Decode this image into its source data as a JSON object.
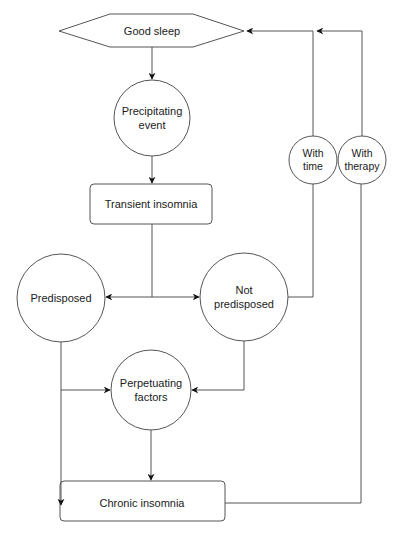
{
  "diagram": {
    "nodes": {
      "good_sleep": {
        "label": "Good sleep",
        "shape": "hexagon"
      },
      "precipitating": {
        "line1": "Precipitating",
        "line2": "event",
        "shape": "circle"
      },
      "transient": {
        "label": "Transient insomnia",
        "shape": "rounded-rect"
      },
      "predisposed": {
        "label": "Predisposed",
        "shape": "circle"
      },
      "not_predisposed": {
        "line1": "Not",
        "line2": "predisposed",
        "shape": "circle"
      },
      "with_time": {
        "line1": "With",
        "line2": "time",
        "shape": "circle"
      },
      "with_therapy": {
        "line1": "With",
        "line2": "therapy",
        "shape": "circle"
      },
      "perpetuating": {
        "line1": "Perpetuating",
        "line2": "factors",
        "shape": "circle"
      },
      "chronic": {
        "label": "Chronic insomnia",
        "shape": "rounded-rect"
      }
    },
    "edges": [
      {
        "from": "Good sleep",
        "to": "Precipitating event"
      },
      {
        "from": "Precipitating event",
        "to": "Transient insomnia"
      },
      {
        "from": "Transient insomnia",
        "to": "Predisposed"
      },
      {
        "from": "Transient insomnia",
        "to": "Not predisposed"
      },
      {
        "from": "Not predisposed",
        "via": "With time",
        "to": "Good sleep"
      },
      {
        "from": "Predisposed",
        "to": "Perpetuating factors"
      },
      {
        "from": "Not predisposed",
        "to": "Perpetuating factors"
      },
      {
        "from": "Predisposed",
        "to": "Chronic insomnia"
      },
      {
        "from": "Perpetuating factors",
        "to": "Chronic insomnia"
      },
      {
        "from": "Chronic insomnia",
        "via": "With therapy",
        "to": "Good sleep"
      }
    ],
    "colors": {
      "stroke": "#555555",
      "text": "#1a1a1a",
      "background": "#ffffff"
    }
  }
}
